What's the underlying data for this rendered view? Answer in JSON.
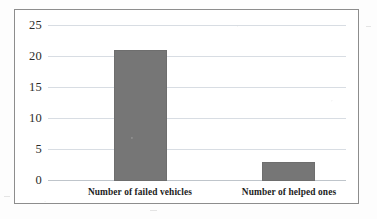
{
  "chart_data": {
    "type": "bar",
    "title": "",
    "subtitle": "",
    "xlabel": "",
    "ylabel": "",
    "categories": [
      "Number of failed vehicles",
      "Number of helped ones"
    ],
    "values": [
      21,
      3
    ],
    "series": [
      {
        "name": "",
        "values": [
          21,
          3
        ]
      }
    ],
    "ylim": [
      0,
      25
    ],
    "ytick_labels": [
      "0",
      "5",
      "10",
      "15",
      "20",
      "25"
    ],
    "ytick_values": [
      0,
      5,
      10,
      15,
      20,
      25
    ],
    "grid": true,
    "grid_axis": "y",
    "legend": false,
    "legend_position": "none",
    "annotations": [],
    "bar_color": "#767676",
    "bar_border_color": "#6e6e6e",
    "gridline_color": "#d8dde3",
    "axis_color": "#bfc5cb",
    "frame_color": "#8d8d8d",
    "text_color": "#1d1d1d",
    "background_color": "#ffffff"
  }
}
